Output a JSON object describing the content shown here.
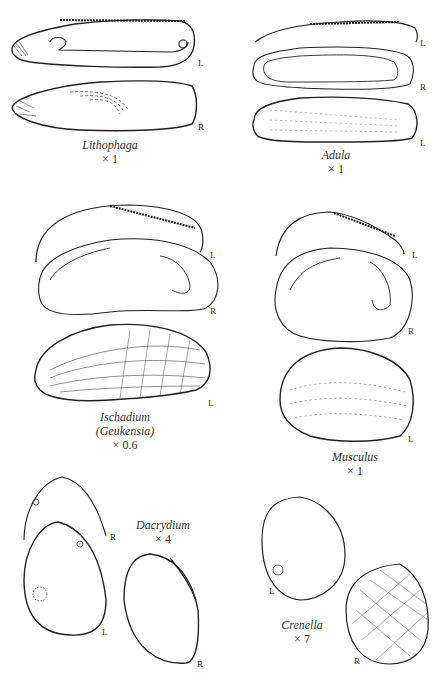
{
  "plate": {
    "specimens": [
      {
        "id": "lithophaga",
        "genus": "Lithophaga",
        "subgenus": "",
        "scale": "× 1",
        "views": [
          "L",
          "R"
        ]
      },
      {
        "id": "adula",
        "genus": "Adula",
        "subgenus": "",
        "scale": "× 1",
        "views": [
          "L",
          "R",
          "L"
        ]
      },
      {
        "id": "ischadium",
        "genus": "Ischadium",
        "subgenus": "(Geukensia)",
        "scale": "× 0.6",
        "views": [
          "L",
          "R",
          "L"
        ]
      },
      {
        "id": "musculus",
        "genus": "Musculus",
        "subgenus": "",
        "scale": "× 1",
        "views": [
          "L",
          "R",
          "L"
        ]
      },
      {
        "id": "dacrydium",
        "genus": "Dacrydium",
        "subgenus": "",
        "scale": "× 4",
        "views": [
          "R",
          "L",
          "R"
        ]
      },
      {
        "id": "crenella",
        "genus": "Crenella",
        "subgenus": "",
        "scale": "× 7",
        "views": [
          "L",
          "R"
        ]
      }
    ]
  },
  "colors": {
    "ink": "#222222",
    "background": "#ffffff"
  }
}
